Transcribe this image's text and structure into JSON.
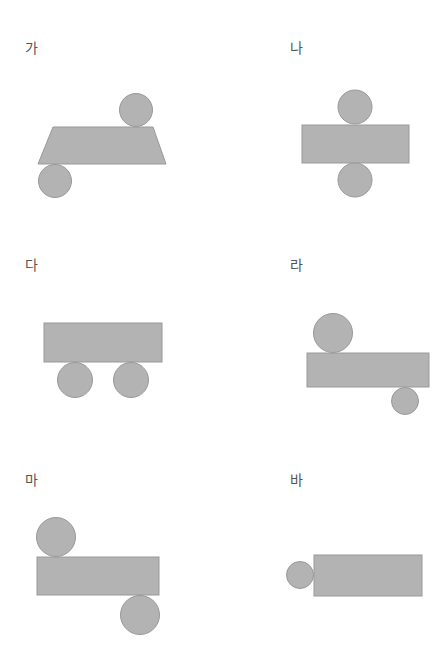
{
  "figures": [
    {
      "id": "ga",
      "label": "가",
      "description": "trapezoid with two circles (top-right and bottom-left)"
    },
    {
      "id": "na",
      "label": "나",
      "description": "rectangle with circles centered above and below"
    },
    {
      "id": "da",
      "label": "다",
      "description": "rectangle with two circles both below"
    },
    {
      "id": "ra",
      "label": "라",
      "description": "rectangle with large circle top-left and small circle bottom-right"
    },
    {
      "id": "ma",
      "label": "마",
      "description": "rectangle with circle top-left and circle bottom-right"
    },
    {
      "id": "ba",
      "label": "바",
      "description": "rectangle with small circle on the left side"
    }
  ],
  "colors": {
    "fill": "#b3b3b3",
    "stroke": "#999999",
    "label": "#555555"
  }
}
